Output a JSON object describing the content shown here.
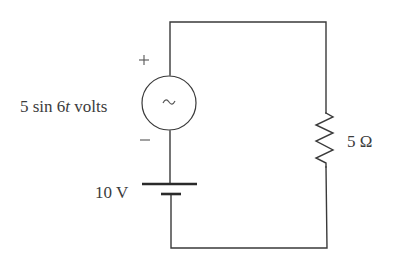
{
  "diagram": {
    "type": "circuit",
    "components": {
      "ac_source": {
        "label_prefix": "5 sin 6",
        "label_var": "t",
        "label_suffix": " volts",
        "symbol": "~",
        "polarity_top": "+",
        "polarity_bottom": "−"
      },
      "battery": {
        "label": "10 V"
      },
      "resistor": {
        "label": "5 Ω"
      }
    },
    "colors": {
      "wire": "#3a3a3a",
      "text": "#3c3c3c",
      "background": "#ffffff"
    }
  }
}
